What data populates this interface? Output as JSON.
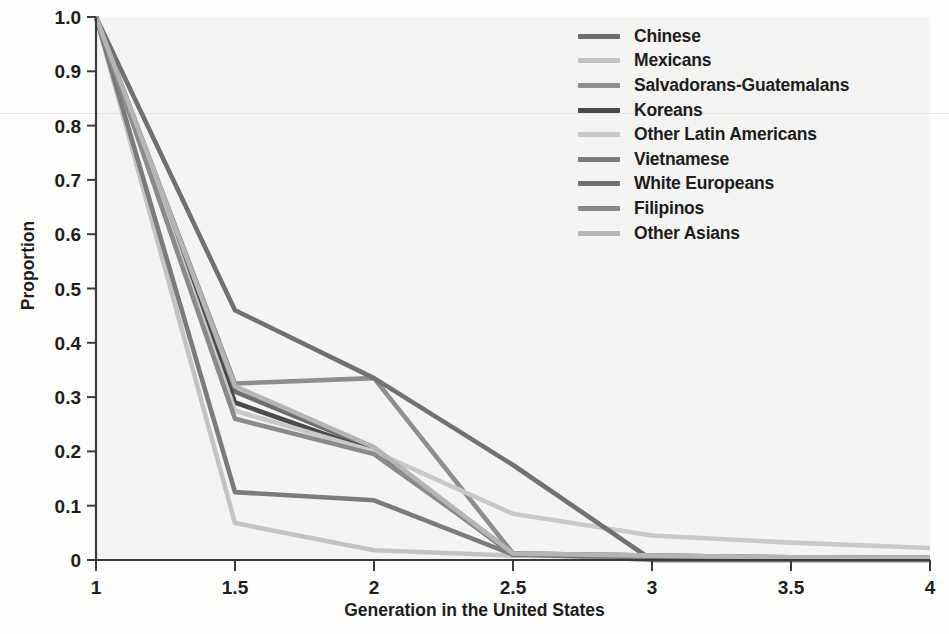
{
  "chart_data": {
    "type": "line",
    "title": "",
    "xlabel": "Generation in the United States",
    "ylabel": "Proportion",
    "x": [
      1,
      1.5,
      2,
      2.5,
      3,
      3.5,
      4
    ],
    "xlim": [
      1,
      4
    ],
    "ylim": [
      0,
      1.0
    ],
    "xticks": [
      "1",
      "1.5",
      "2",
      "2.5",
      "3",
      "3.5",
      "4"
    ],
    "yticks": [
      "0",
      "0.1",
      "0.2",
      "0.3",
      "0.4",
      "0.5",
      "0.6",
      "0.7",
      "0.8",
      "0.9",
      "1.0"
    ],
    "grid": false,
    "legend_position": "top-right",
    "series": [
      {
        "name": "Chinese",
        "color": "#6e6e6e",
        "values": [
          1.0,
          0.31,
          0.205,
          0.012,
          0.008,
          0.005,
          0.004
        ]
      },
      {
        "name": "Mexicans",
        "color": "#c3c3c3",
        "values": [
          1.0,
          0.068,
          0.018,
          0.008,
          0.006,
          0.004,
          0.003
        ]
      },
      {
        "name": "Salvadorans-Guatemalans",
        "color": "#8e8e8e",
        "values": [
          1.0,
          0.325,
          0.335,
          0.012,
          0.0,
          0.0,
          0.0
        ]
      },
      {
        "name": "Koreans",
        "color": "#4a4a4a",
        "values": [
          1.0,
          0.29,
          0.2,
          0.01,
          0.006,
          0.004,
          0.003
        ]
      },
      {
        "name": "Other Latin Americans",
        "color": "#c9c9c9",
        "values": [
          1.0,
          0.275,
          0.2,
          0.085,
          0.045,
          0.032,
          0.022
        ]
      },
      {
        "name": "Vietnamese",
        "color": "#7b7b7b",
        "values": [
          1.0,
          0.125,
          0.11,
          0.01,
          0.006,
          0.004,
          0.003
        ]
      },
      {
        "name": "White Europeans",
        "color": "#717171",
        "values": [
          1.0,
          0.46,
          0.335,
          0.175,
          0.0,
          0.0,
          0.0
        ]
      },
      {
        "name": "Filipinos",
        "color": "#8a8a8a",
        "values": [
          1.0,
          0.26,
          0.195,
          0.012,
          0.008,
          0.005,
          0.004
        ]
      },
      {
        "name": "Other Asians",
        "color": "#b5b5b5",
        "values": [
          1.0,
          0.32,
          0.208,
          0.012,
          0.008,
          0.005,
          0.004
        ]
      }
    ]
  }
}
